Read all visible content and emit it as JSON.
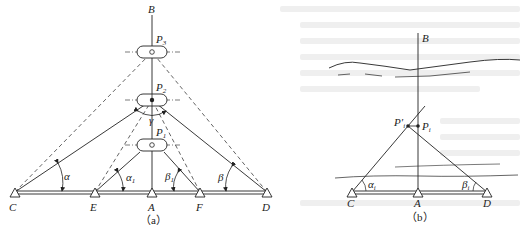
{
  "figure_a": {
    "caption": "（a）",
    "points": {
      "B": "B",
      "P3": "P",
      "P3_sub": "3",
      "P2": "P",
      "P2_sub": "2",
      "P1": "P",
      "P1_sub": "1",
      "C": "C",
      "E": "E",
      "A": "A",
      "F": "F",
      "D": "D"
    },
    "angles": {
      "alpha": "α",
      "alpha1": "α",
      "alpha1_sub": "1",
      "beta": "β",
      "beta1": "β",
      "beta1_sub": "1",
      "gamma": "γ"
    }
  },
  "figure_b": {
    "caption": "（b）",
    "points": {
      "B": "B",
      "Pi_prime": "P′",
      "Pi_prime_sub": "i",
      "Pi": "P",
      "Pi_sub": "i",
      "C": "C",
      "A": "A",
      "D": "D"
    },
    "angles": {
      "alpha_i": "α",
      "alpha_i_sub": "i",
      "beta_i": "β",
      "beta_i_sub": "i"
    }
  },
  "colors": {
    "line": "#222222",
    "background": "#ffffff",
    "ghost_text": "#efefef"
  }
}
